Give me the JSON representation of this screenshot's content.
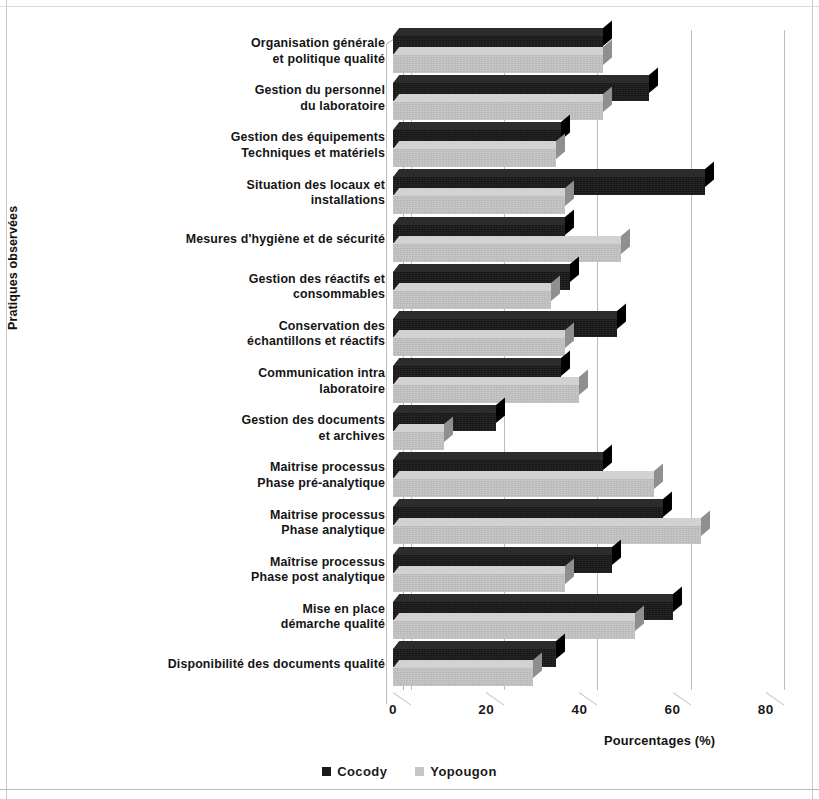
{
  "chart_data": {
    "type": "bar",
    "orientation": "horizontal",
    "title": "",
    "xlabel": "Pourcentages (%)",
    "ylabel": "Pratiques observées",
    "xlim": [
      0,
      90
    ],
    "xticks": [
      "0",
      "20",
      "40",
      "60",
      "80"
    ],
    "xtick_values": [
      0,
      20,
      40,
      60,
      80
    ],
    "grid": true,
    "legend_position": "bottom",
    "categories": [
      "Organisation générale\net politique qualité",
      "Gestion du personnel\ndu laboratoire",
      "Gestion des équipements\nTechniques et matériels",
      "Situation des locaux et\ninstallations",
      "Mesures d'hygiène et de sécurité",
      "Gestion des réactifs et\nconsommables",
      "Conservation des\néchantillons et réactifs",
      "Communication intra\nlaboratoire",
      "Gestion des documents\net archives",
      "Maitrise processus\nPhase pré-analytique",
      "Maitrise processus\nPhase analytique",
      "Maîtrise processus\nPhase post analytique",
      "Mise en place\ndémarche qualité",
      "Disponibilité des documents qualité"
    ],
    "series": [
      {
        "name": "Cocody",
        "color": "#1a1a1a",
        "values": [
          45,
          55,
          36,
          67,
          37,
          38,
          48,
          36,
          22,
          45,
          58,
          47,
          60,
          35
        ]
      },
      {
        "name": "Yopougon",
        "color": "#c6c6c6",
        "values": [
          45,
          45,
          35,
          37,
          49,
          34,
          37,
          40,
          11,
          56,
          66,
          37,
          52,
          30
        ]
      }
    ]
  },
  "legend": {
    "items": [
      {
        "label": "Cocody",
        "color": "#1a1a1a"
      },
      {
        "label": "Yopougon",
        "color": "#c6c6c6"
      }
    ]
  }
}
